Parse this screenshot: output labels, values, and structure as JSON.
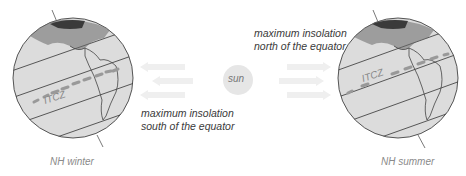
{
  "diagram": {
    "sun": {
      "label": "sun",
      "color": "#e6e6e6"
    },
    "left_panel": {
      "caption": "NH winter",
      "band_label": "ITCZ",
      "insolation_text_line1": "maximum insolation",
      "insolation_text_line2": "south of the equator",
      "arrow_direction": "left"
    },
    "right_panel": {
      "caption": "NH summer",
      "band_label": "ITCZ",
      "insolation_text_line1": "maximum insolation",
      "insolation_text_line2": "north of the equator",
      "arrow_direction": "right"
    },
    "colors": {
      "globe_fill": "#dcdcdc",
      "globe_outline": "#444444",
      "itcz_dash": "#999999",
      "arrow": "#eeeeee",
      "caption_text": "#8a8a8a",
      "label_text": "#3a3a3a"
    }
  }
}
